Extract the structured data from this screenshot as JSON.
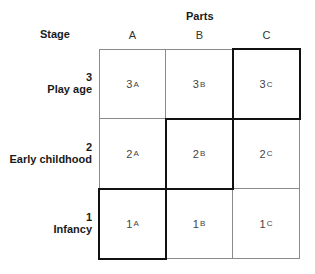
{
  "title": "Parts",
  "stage_header": "Stage",
  "columns": [
    "A",
    "B",
    "C"
  ],
  "rows": [
    {
      "number": "3",
      "label": "Play age",
      "cells": [
        {
          "base": "3",
          "sub": "A"
        },
        {
          "base": "3",
          "sub": "B"
        },
        {
          "base": "3",
          "sub": "C"
        }
      ]
    },
    {
      "number": "2",
      "label": "Early childhood",
      "cells": [
        {
          "base": "2",
          "sub": "A"
        },
        {
          "base": "2",
          "sub": "B"
        },
        {
          "base": "2",
          "sub": "C"
        }
      ]
    },
    {
      "number": "1",
      "label": "Infancy",
      "cells": [
        {
          "base": "1",
          "sub": "A"
        },
        {
          "base": "1",
          "sub": "B"
        },
        {
          "base": "1",
          "sub": "C"
        }
      ]
    }
  ],
  "highlighted_cells": [
    "3C",
    "2B",
    "1A"
  ],
  "colors": {
    "grid_line": "#8a8a8a",
    "highlight": "#111111"
  }
}
